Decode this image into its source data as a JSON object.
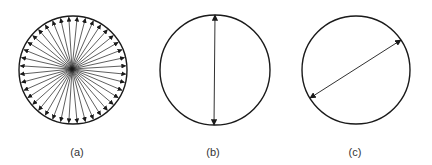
{
  "figure": {
    "stroke_color": "#1a1a1a",
    "panels": [
      {
        "id": "a",
        "label": "(a)",
        "description": "Circle with many arrows radiating from the center to the circumference",
        "circle": {
          "cx": 73,
          "cy": 70,
          "r": 54
        },
        "arrow_origin": {
          "x": 72,
          "y": 69
        },
        "radial_arrow_count": 40
      },
      {
        "id": "b",
        "label": "(b)",
        "description": "Circle with a vertical double-headed arrow spanning the diameter",
        "circle": {
          "cx": 215,
          "cy": 70,
          "r": 55
        },
        "arrow": {
          "x1": 215,
          "y1": 15,
          "x2": 214,
          "y2": 125
        }
      },
      {
        "id": "c",
        "label": "(c)",
        "description": "Circle with a diagonal double-headed arrow spanning a chord from lower-left to upper-right",
        "circle": {
          "cx": 356,
          "cy": 70,
          "r": 54
        },
        "arrow": {
          "x1": 310,
          "y1": 98,
          "x2": 401,
          "y2": 40
        }
      }
    ]
  }
}
